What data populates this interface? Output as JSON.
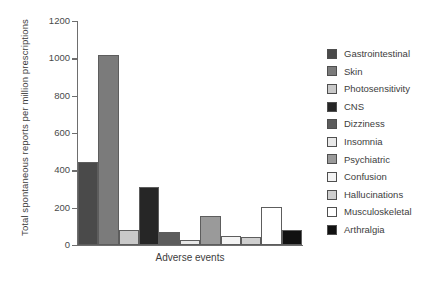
{
  "chart_data": {
    "type": "bar",
    "title": "",
    "xlabel": "Adverse events",
    "ylabel": "Total spontaneous reports per million prescriptions",
    "ylim": [
      0,
      1200
    ],
    "yticks": [
      0,
      200,
      400,
      600,
      800,
      1000,
      1200
    ],
    "ytick_labels": [
      "0",
      "200",
      "400",
      "600",
      "800",
      "1000",
      "1200"
    ],
    "grid": false,
    "legend_position": "right",
    "categories": [
      "Gastrointestinal",
      "Skin",
      "Photosensitivity",
      "CNS",
      "Dizziness",
      "Insomnia",
      "Psychiatric",
      "Confusion",
      "Hallucinations",
      "Musculoskeletal",
      "Arthralgia"
    ],
    "values": [
      445,
      1020,
      80,
      310,
      70,
      25,
      155,
      50,
      45,
      205,
      80
    ],
    "colors": [
      "#4a4a4a",
      "#7b7b7b",
      "#c9c9c9",
      "#262626",
      "#5c5c5c",
      "#e8e8e8",
      "#9a9a9a",
      "#f3f3f3",
      "#cfcfcf",
      "#ffffff",
      "#111111"
    ],
    "axis_color": "#6e6e6e",
    "bar_edge_color": "#5d5d5d"
  },
  "legend": {
    "items": [
      {
        "label": "Gastrointestinal",
        "color": "#4a4a4a"
      },
      {
        "label": "Skin",
        "color": "#7b7b7b"
      },
      {
        "label": "Photosensitivity",
        "color": "#c9c9c9"
      },
      {
        "label": "CNS",
        "color": "#262626"
      },
      {
        "label": "Dizziness",
        "color": "#5c5c5c"
      },
      {
        "label": "Insomnia",
        "color": "#e8e8e8"
      },
      {
        "label": "Psychiatric",
        "color": "#9a9a9a"
      },
      {
        "label": "Confusion",
        "color": "#f3f3f3"
      },
      {
        "label": "Hallucinations",
        "color": "#cfcfcf"
      },
      {
        "label": "Musculoskeletal",
        "color": "#ffffff"
      },
      {
        "label": "Arthralgia",
        "color": "#111111"
      }
    ]
  }
}
